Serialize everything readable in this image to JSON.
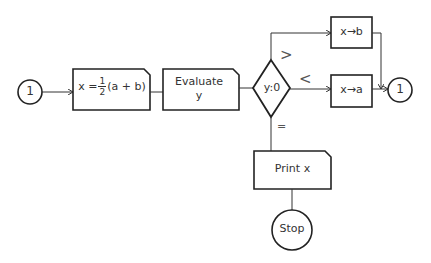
{
  "diagram": {
    "type": "flowchart",
    "nodes": {
      "start_connector": {
        "label": "1",
        "shape": "circle"
      },
      "compute_x": {
        "label_prefix": "x =",
        "frac_num": "1",
        "frac_den": "2",
        "label_suffix": "(a + b)",
        "shape": "process-box"
      },
      "evaluate_y": {
        "line1": "Evaluate",
        "line2": "y",
        "shape": "process-box"
      },
      "decision": {
        "label": "y:0",
        "shape": "diamond"
      },
      "assign_b": {
        "label": "x→b",
        "shape": "box"
      },
      "assign_a": {
        "label": "x→a",
        "shape": "box"
      },
      "end_connector": {
        "label": "1",
        "shape": "circle"
      },
      "print_x": {
        "label": "Print x",
        "shape": "process-box"
      },
      "stop": {
        "label": "Stop",
        "shape": "circle"
      }
    },
    "edge_labels": {
      "greater": ">",
      "less": "<",
      "equal": "="
    },
    "colors": {
      "stroke": "#222222",
      "text": "#333333",
      "background": "#ffffff"
    }
  }
}
